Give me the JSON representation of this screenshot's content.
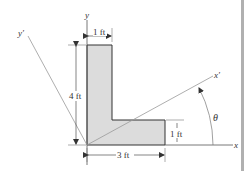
{
  "figure": {
    "axes": {
      "x_label": "x",
      "y_label": "y",
      "x_prime_label": "x′",
      "y_prime_label": "y′",
      "angle_label": "θ"
    },
    "dimensions": {
      "stem_width": "1 ft",
      "height": "4 ft",
      "leg_thickness": "1 ft",
      "base_width": "3 ft"
    },
    "colors": {
      "fill": "#dcdcdc",
      "outline": "#333333",
      "axis": "#555555",
      "rotated_axis": "#999999",
      "edge_bar": "#b0b0b0"
    }
  }
}
